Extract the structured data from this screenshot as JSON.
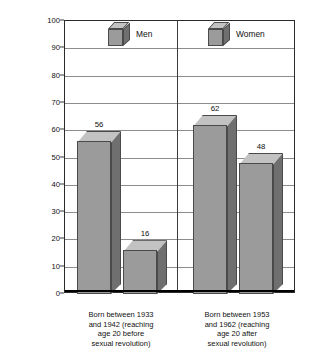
{
  "chart_data": {
    "type": "bar",
    "title": "",
    "subtitle": "",
    "xlabel": "",
    "ylabel_line1": "Percentage Reporting Two or",
    "ylabel_line2": "More Sexual Partners by Age 20",
    "ylim": [
      0,
      100
    ],
    "ytick_step": 10,
    "yticks": [
      "0",
      "10",
      "20",
      "30",
      "40",
      "50",
      "60",
      "70",
      "80",
      "90",
      "100"
    ],
    "grid": true,
    "legend_position": "top-inside",
    "categories": [
      "Born between 1933 and 1942 (reaching age 20 before sexual revolution)",
      "Born between 1953 and 1962 (reaching age 20 after sexual revolution)"
    ],
    "category_lines": [
      [
        "Born between 1933",
        "and 1942 (reaching",
        "age 20 before",
        "sexual revolution)"
      ],
      [
        "Born between 1953",
        "and 1962 (reaching",
        "age 20 after",
        "sexual revolution)"
      ]
    ],
    "series": [
      {
        "name": "Men",
        "values": [
          56,
          62
        ]
      },
      {
        "name": "Women",
        "values": [
          16,
          48
        ]
      }
    ],
    "bars": [
      {
        "group": 0,
        "series": "Men",
        "value": 56,
        "label": "56"
      },
      {
        "group": 0,
        "series": "Women",
        "value": 16,
        "label": "16"
      },
      {
        "group": 1,
        "series": "Men",
        "value": 62,
        "label": "62"
      },
      {
        "group": 1,
        "series": "Women",
        "value": 48,
        "label": "48"
      }
    ],
    "colors": {
      "bar_front": "#9b9b9b",
      "bar_top": "#c2c2c2",
      "bar_side": "#6f6f6f",
      "bar_edge": "#4a4a4a",
      "gridline": "#8d8d8d",
      "axis": "#2b2b2b",
      "text": "#111111",
      "background": "#ffffff"
    }
  },
  "legend": {
    "items": [
      {
        "label": "Men",
        "icon": "cube-icon"
      },
      {
        "label": "Women",
        "icon": "cube-icon"
      }
    ]
  }
}
